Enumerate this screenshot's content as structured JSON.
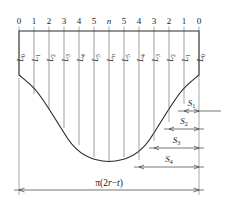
{
  "figure": {
    "top_scale": {
      "name": "division-index-scale",
      "ticks": [
        "0",
        "1",
        "2",
        "3",
        "4",
        "5",
        "n",
        "5",
        "4",
        "3",
        "2",
        "1",
        "0"
      ],
      "italic_ticks": [
        "n"
      ]
    },
    "element_labels": {
      "name": "generatrix-length-labels",
      "base": "L",
      "items": [
        {
          "base": "L",
          "sub": "0"
        },
        {
          "base": "L",
          "sub": "1"
        },
        {
          "base": "L",
          "sub": "2"
        },
        {
          "base": "L",
          "sub": "3"
        },
        {
          "base": "L",
          "sub": "4"
        },
        {
          "base": "L",
          "sub": "5"
        },
        {
          "base": "L",
          "sub": "n"
        },
        {
          "base": "L",
          "sub": "5"
        },
        {
          "base": "L",
          "sub": "4"
        },
        {
          "base": "L",
          "sub": "3"
        },
        {
          "base": "L",
          "sub": "2"
        },
        {
          "base": "L",
          "sub": "1"
        },
        {
          "base": "L",
          "sub": "0"
        }
      ]
    },
    "side_dimensions": {
      "name": "arc-offset-dimensions",
      "items": [
        {
          "base": "S",
          "sub": "1"
        },
        {
          "base": "S",
          "sub": "2"
        },
        {
          "base": "S",
          "sub": "3"
        },
        {
          "base": "S",
          "sub": "4"
        }
      ]
    },
    "bottom_dimension": {
      "name": "developed-circumference-dimension",
      "prefix": "π(2",
      "var1": "r",
      "minus": "−",
      "var2": "t",
      "suffix": ")",
      "full": "π(2r−t)"
    },
    "colors": {
      "outline": "#2b2b2b",
      "grid": "#8d8d8d",
      "dimension": "#3a3a3a",
      "background": "#ffffff"
    }
  }
}
